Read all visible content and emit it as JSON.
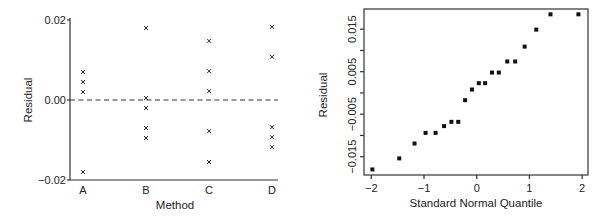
{
  "chart_data": [
    {
      "type": "scatter",
      "title": "",
      "xlabel": "Method",
      "ylabel": "Residual",
      "categories": [
        "A",
        "B",
        "C",
        "D"
      ],
      "ylim": [
        -0.02,
        0.02
      ],
      "yticks": [
        -0.02,
        0.0,
        0.02
      ],
      "ytick_labels": [
        "−0.02",
        "0.00",
        "0.02"
      ],
      "reference_line": {
        "y": 0.0,
        "style": "dashed"
      },
      "marker": "x",
      "grid": false,
      "series": [
        {
          "name": "A",
          "values": [
            0.007,
            0.0045,
            0.002,
            -0.018
          ]
        },
        {
          "name": "B",
          "values": [
            0.018,
            0.0005,
            -0.002,
            -0.007,
            -0.0095
          ]
        },
        {
          "name": "C",
          "values": [
            0.0148,
            0.0072,
            0.0022,
            -0.0078,
            -0.0155
          ]
        },
        {
          "name": "D",
          "values": [
            0.0183,
            0.0108,
            -0.0068,
            -0.0093,
            -0.0118
          ]
        }
      ]
    },
    {
      "type": "scatter",
      "title": "",
      "xlabel": "Standard Normal Quantile",
      "ylabel": "Residual",
      "xlim": [
        -2.1,
        2.1
      ],
      "ylim": [
        -0.0195,
        0.0195
      ],
      "xticks": [
        -2,
        -1,
        0,
        1,
        2
      ],
      "xtick_labels": [
        "−2",
        "−1",
        "0",
        "1",
        "2"
      ],
      "yticks_minor": [
        -0.015,
        -0.01,
        -0.005,
        0.0,
        0.005,
        0.01,
        0.015
      ],
      "yticks": [
        -0.015,
        -0.005,
        0.005,
        0.015
      ],
      "ytick_labels": [
        "−0.015",
        "−0.005",
        "0.005",
        "0.015"
      ],
      "marker": "square",
      "grid": false,
      "x": [
        -1.98,
        -1.47,
        -1.18,
        -0.97,
        -0.78,
        -0.62,
        -0.48,
        -0.35,
        -0.22,
        -0.09,
        0.04,
        0.16,
        0.29,
        0.42,
        0.58,
        0.73,
        0.91,
        1.13,
        1.4,
        1.93
      ],
      "y": [
        -0.018,
        -0.0154,
        -0.0119,
        -0.0094,
        -0.0094,
        -0.0078,
        -0.0068,
        -0.0068,
        -0.0017,
        0.0008,
        0.0023,
        0.0023,
        0.0048,
        0.0048,
        0.0074,
        0.0074,
        0.0109,
        0.0149,
        0.0185,
        0.0185
      ]
    }
  ]
}
